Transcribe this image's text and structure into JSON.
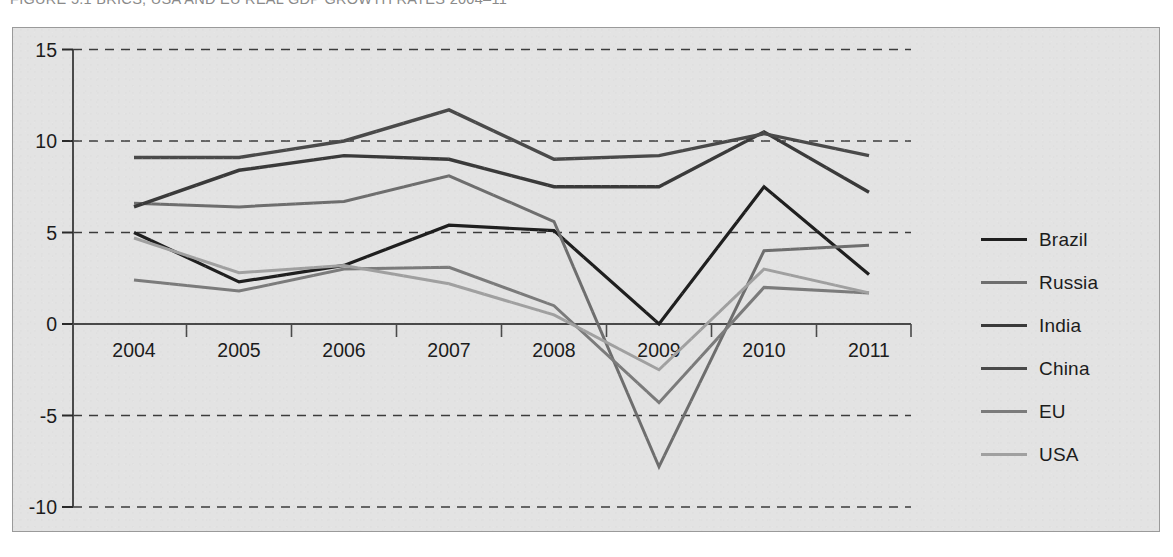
{
  "figure": {
    "title": "FIGURE 5.1 BRICS, USA AND EU REAL GDP GROWTH RATES 2004–11",
    "panel_background": "#e3e3e3",
    "panel_border": "#9a9a9a"
  },
  "legend": {
    "position": "right",
    "entries": [
      {
        "label": "Brazil",
        "color": "#1f1f1f",
        "width": 3.2
      },
      {
        "label": "Russia",
        "color": "#6e6e6e",
        "width": 3.0
      },
      {
        "label": "India",
        "color": "#3a3a3a",
        "width": 3.4
      },
      {
        "label": "China",
        "color": "#4a4a4a",
        "width": 3.4
      },
      {
        "label": "EU",
        "color": "#7b7b7b",
        "width": 3.0
      },
      {
        "label": "USA",
        "color": "#a0a0a0",
        "width": 3.0
      }
    ]
  },
  "chart_data": {
    "type": "line",
    "title": "BRICS, USA AND EU REAL GDP GROWTH RATES 2004–11",
    "xlabel": "",
    "ylabel": "",
    "categories": [
      "2004",
      "2005",
      "2006",
      "2007",
      "2008",
      "2009",
      "2010",
      "2011"
    ],
    "x": [
      2004,
      2005,
      2006,
      2007,
      2008,
      2009,
      2010,
      2011
    ],
    "ylim": [
      -10,
      15
    ],
    "yticks": [
      15,
      10,
      5,
      0,
      -5,
      -10
    ],
    "ytick_labels": [
      "15",
      "10",
      "5",
      "0",
      "-5",
      "-10"
    ],
    "grid": "horizontal-dashed",
    "legend_position": "right",
    "series": [
      {
        "name": "Brazil",
        "color": "#1f1f1f",
        "values": [
          5.0,
          2.3,
          3.2,
          5.4,
          5.1,
          0.0,
          7.5,
          2.7
        ]
      },
      {
        "name": "Russia",
        "color": "#6e6e6e",
        "values": [
          6.6,
          6.4,
          6.7,
          8.1,
          5.6,
          -7.8,
          4.0,
          4.3
        ]
      },
      {
        "name": "India",
        "color": "#3a3a3a",
        "values": [
          6.4,
          8.4,
          9.2,
          9.0,
          7.5,
          7.5,
          10.5,
          7.2
        ]
      },
      {
        "name": "China",
        "color": "#4a4a4a",
        "values": [
          9.1,
          9.1,
          10.0,
          11.7,
          9.0,
          9.2,
          10.4,
          9.2
        ]
      },
      {
        "name": "EU",
        "color": "#7b7b7b",
        "values": [
          2.4,
          1.8,
          3.0,
          3.1,
          1.0,
          -4.3,
          2.0,
          1.7
        ]
      },
      {
        "name": "USA",
        "color": "#a0a0a0",
        "values": [
          4.7,
          2.8,
          3.2,
          2.2,
          0.5,
          -2.5,
          3.0,
          1.7
        ]
      }
    ]
  }
}
